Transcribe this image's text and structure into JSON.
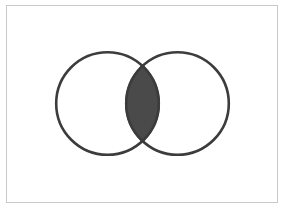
{
  "diagram": {
    "type": "venn",
    "sets": [
      {
        "name": "set-a",
        "cx": 107.5,
        "cy": 103.5,
        "r": 52.5
      },
      {
        "name": "set-b",
        "cx": 177.5,
        "cy": 103.5,
        "r": 52.5
      }
    ],
    "shaded_region": "intersection",
    "colors": {
      "stroke": "#3c3c3c",
      "fill": "#4a4a4a",
      "frame": "#c9c9c9",
      "background": "#ffffff"
    }
  }
}
